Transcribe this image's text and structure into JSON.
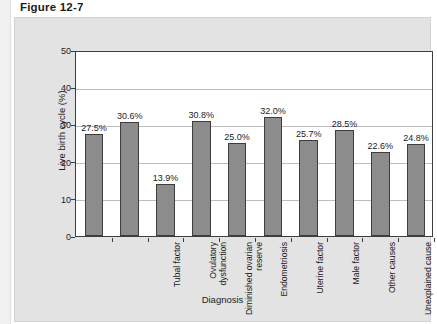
{
  "figure": {
    "title": "Figure 12-7"
  },
  "chart_data": {
    "type": "bar",
    "title": "Figure 12-7",
    "xlabel": "Diagnosis",
    "ylabel": "Live birth cycle (%)",
    "ylim": [
      0,
      50
    ],
    "yticks": [
      "0",
      "10",
      "20",
      "30",
      "40",
      "50"
    ],
    "grid": true,
    "legend": "none",
    "categories": [
      "Tubal factor",
      "Ovulatory\ndysfunction",
      "Diminished ovarian\nreserve",
      "Endometriosis",
      "Uterine factor",
      "Male factor",
      "Other causes",
      "Unexplained cause",
      "Multiple factors,\nfemale only",
      "Multiple factors,\nfemale + male"
    ],
    "values": [
      27.5,
      30.6,
      13.9,
      30.8,
      25.0,
      32.0,
      25.7,
      28.5,
      22.6,
      24.8
    ],
    "value_labels": [
      "27.5%",
      "30.6%",
      "13.9%",
      "30.8%",
      "25.0%",
      "32.0%",
      "25.7%",
      "28.5%",
      "22.6%",
      "24.8%"
    ],
    "colors": {
      "bar_fill": "#8c8c8c",
      "bar_border": "#3d3d3d",
      "plot_background": "#ffffff",
      "panel_background": "#e3e3e3",
      "gridline": "#bdbdbd",
      "text": "#1b1b1b"
    }
  }
}
